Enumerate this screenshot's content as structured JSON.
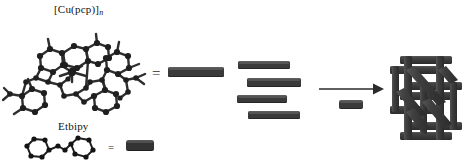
{
  "figure": {
    "type": "chemistry-schematic",
    "background_color": "#ffffff",
    "ink_color": "#1a1a1a",
    "rod_color": "#3a3a3a"
  },
  "labels": {
    "complex_name": "[Cu(pcp)]",
    "complex_subscript": "n",
    "ligand_name": "Etbipy"
  },
  "equals_signs": {
    "top": "=",
    "bottom": "="
  },
  "structures": {
    "complex": {
      "name": "cu-pcp-ball-and-stick-structure",
      "description": "ball-and-stick crystal structure of copper pcp complex with aromatic rings"
    },
    "ligand": {
      "name": "etbipy-skeletal-structure",
      "description": "bipyridine skeletal structure with two hexagonal aromatic rings joined by a linker"
    },
    "framework": {
      "name": "three-dimensional-coordination-framework",
      "description": "interpenetrated 3D lattice built from rods"
    }
  },
  "rods": {
    "legend_top": {
      "name": "complex-rod-legend",
      "width": 56,
      "height": 10
    },
    "legend_bottom": {
      "name": "ligand-rod-legend",
      "width": 28,
      "height": 11
    },
    "stack": [
      {
        "name": "stacked-rod-1",
        "width": 52,
        "height": 8,
        "offset": 0
      },
      {
        "name": "stacked-rod-2",
        "width": 54,
        "height": 9,
        "offset": 9
      },
      {
        "name": "stacked-rod-3",
        "width": 50,
        "height": 8,
        "offset": -1
      },
      {
        "name": "stacked-rod-4",
        "width": 52,
        "height": 8,
        "offset": 10
      }
    ],
    "arrow_sub": {
      "name": "linker-rod-under-arrow",
      "width": 24,
      "height": 9
    }
  },
  "arrow": {
    "name": "assembly-arrow",
    "direction": "right",
    "color": "#2b2b2b"
  }
}
